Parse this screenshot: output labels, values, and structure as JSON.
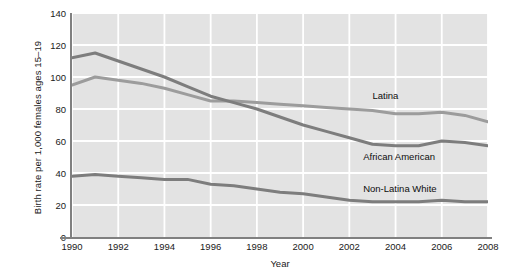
{
  "chart_data": {
    "type": "line",
    "title": "",
    "xlabel": "Year",
    "ylabel": "Birth rate per 1,000 females ages 15–19",
    "xlim": [
      1990,
      2008
    ],
    "ylim": [
      0,
      140
    ],
    "grid": true,
    "legend_position": "inline-right",
    "x": [
      1990,
      1991,
      1992,
      1993,
      1994,
      1995,
      1996,
      1997,
      1998,
      1999,
      2000,
      2001,
      2002,
      2003,
      2004,
      2005,
      2006,
      2007,
      2008
    ],
    "xticks": [
      "1990",
      "1992",
      "1994",
      "1996",
      "1998",
      "2000",
      "2002",
      "2004",
      "2006",
      "2008"
    ],
    "yticks": [
      "0",
      "20",
      "40",
      "60",
      "80",
      "100",
      "120",
      "140"
    ],
    "series": [
      {
        "name": "Latina",
        "color": "#9c9c9c",
        "values": [
          95,
          100,
          98,
          96,
          93,
          89,
          85,
          85,
          84,
          83,
          82,
          81,
          80,
          79,
          77,
          77,
          78,
          76,
          72
        ]
      },
      {
        "name": "African American",
        "color": "#7d7d7d",
        "values": [
          112,
          115,
          110,
          105,
          100,
          94,
          88,
          84,
          80,
          75,
          70,
          66,
          62,
          58,
          57,
          57,
          60,
          59,
          57
        ]
      },
      {
        "name": "Non-Latina White",
        "color": "#7d7d7d",
        "values": [
          38,
          39,
          38,
          37,
          36,
          36,
          33,
          32,
          30,
          28,
          27,
          25,
          23,
          22,
          22,
          22,
          23,
          22,
          22
        ]
      }
    ],
    "annotations": [
      {
        "text": "Latina",
        "x": 2003,
        "y": 88
      },
      {
        "text": "African American",
        "x": 2002.6,
        "y": 50
      },
      {
        "text": "Non-Latina White",
        "x": 2002.6,
        "y": 30
      }
    ],
    "colors": {
      "plot_background": "#e3e3e3",
      "gridline": "#ffffff",
      "axis": "#808080",
      "text": "#1a1a1a"
    }
  }
}
